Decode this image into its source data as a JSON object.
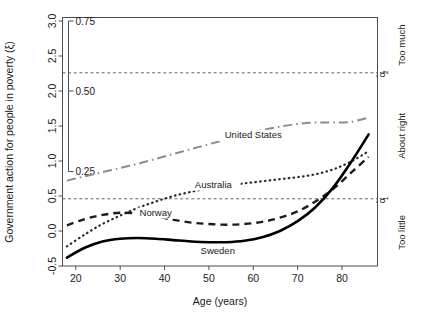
{
  "chart_data": {
    "type": "line",
    "title": "",
    "xlabel": "Age (years)",
    "ylabel": "Government action for people in poverty (ξ)",
    "xlim": [
      17.0,
      88.0
    ],
    "ylim": [
      -0.5,
      3.05
    ],
    "xticks": [
      20,
      30,
      40,
      50,
      60,
      70,
      80
    ],
    "xticklabels": [
      "20",
      "30",
      "40",
      "50",
      "60",
      "70",
      "80"
    ],
    "yticks": [
      -0.5,
      0.0,
      0.5,
      1.0,
      1.5,
      2.0,
      2.5,
      3.0
    ],
    "yticklabels": [
      "-0.5",
      "0.0",
      "0.5",
      "1.0",
      "1.5",
      "2.0",
      "2.5",
      "3.0"
    ],
    "grid": false,
    "legend_position": "inline-labels",
    "secondary_axis": {
      "name": "probability-axis",
      "ticks": [
        0.25,
        0.5,
        0.75
      ],
      "ticklabels": [
        "0.25",
        "0.50",
        "0.75"
      ],
      "tick_positions_in_xi": [
        0.85,
        2.0,
        3.0
      ],
      "range_in_xi": [
        0.85,
        3.0
      ]
    },
    "thresholds": [
      {
        "name": "alpha-hat-2",
        "label": "α̂2",
        "value": 2.26,
        "style": "dashed"
      },
      {
        "name": "alpha-hat-1",
        "label": "α̂1",
        "value": 0.46,
        "style": "dashed"
      }
    ],
    "right_category_labels": [
      {
        "name": "too-much",
        "label": "Too much",
        "from": 2.26,
        "to": 3.05
      },
      {
        "name": "about-right",
        "label": "About right",
        "from": 0.46,
        "to": 2.26
      },
      {
        "name": "too-little",
        "label": "Too little",
        "from": -0.5,
        "to": 0.46
      }
    ],
    "series": [
      {
        "name": "United States",
        "style": "dashdot",
        "color": "#8c8c8c",
        "label_x": 60,
        "label_y": 1.33,
        "x": [
          18,
          22,
          26,
          30,
          34,
          38,
          42,
          46,
          50,
          54,
          58,
          62,
          66,
          70,
          74,
          78,
          82,
          86
        ],
        "y": [
          0.72,
          0.78,
          0.84,
          0.9,
          0.96,
          1.03,
          1.1,
          1.17,
          1.24,
          1.31,
          1.38,
          1.44,
          1.49,
          1.53,
          1.55,
          1.55,
          1.56,
          1.62
        ]
      },
      {
        "name": "Australia",
        "style": "dotted",
        "color": "#2a2a2a",
        "label_x": 51,
        "label_y": 0.62,
        "x": [
          18,
          22,
          26,
          30,
          34,
          38,
          42,
          46,
          50,
          54,
          58,
          62,
          66,
          70,
          74,
          78,
          82,
          86
        ],
        "y": [
          -0.22,
          -0.05,
          0.1,
          0.22,
          0.33,
          0.42,
          0.5,
          0.56,
          0.61,
          0.65,
          0.68,
          0.71,
          0.74,
          0.77,
          0.81,
          0.88,
          0.99,
          1.14
        ]
      },
      {
        "name": "Norway",
        "style": "dashed",
        "color": "#1c1c1c",
        "label_x": 38,
        "label_y": 0.22,
        "x": [
          18,
          22,
          26,
          30,
          34,
          38,
          42,
          46,
          50,
          54,
          58,
          62,
          66,
          70,
          74,
          78,
          82,
          86
        ],
        "y": [
          0.08,
          0.17,
          0.23,
          0.26,
          0.25,
          0.21,
          0.16,
          0.12,
          0.1,
          0.09,
          0.1,
          0.13,
          0.19,
          0.28,
          0.42,
          0.6,
          0.83,
          1.06
        ]
      },
      {
        "name": "Sweden",
        "style": "solid",
        "color": "#000000",
        "label_x": 52,
        "label_y": -0.33,
        "x": [
          18,
          22,
          26,
          30,
          34,
          38,
          42,
          46,
          50,
          54,
          58,
          62,
          66,
          70,
          74,
          78,
          82,
          86
        ],
        "y": [
          -0.38,
          -0.24,
          -0.15,
          -0.11,
          -0.1,
          -0.11,
          -0.13,
          -0.15,
          -0.16,
          -0.16,
          -0.14,
          -0.09,
          0.0,
          0.14,
          0.34,
          0.62,
          0.98,
          1.38
        ]
      }
    ]
  }
}
